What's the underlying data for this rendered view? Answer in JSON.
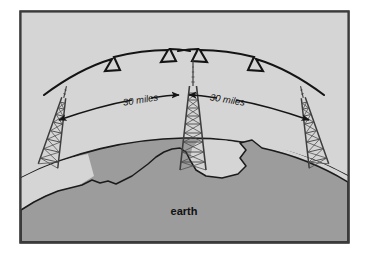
{
  "figure": {
    "kind": "diagram",
    "title_visible": false,
    "frame": {
      "border_color": "#3a3a3a",
      "sky_color": "#d4d4d4",
      "earth_color": "#9a9a9a",
      "line_color": "#1a1a1a",
      "x": 20,
      "y": 11,
      "width": 329,
      "height": 232
    },
    "labels": {
      "earth": "earth",
      "distance_left": "30 miles",
      "distance_right": "30 miles"
    },
    "towers": [
      {
        "name": "left-tower",
        "x": 48,
        "base_y": 166,
        "top_y": 84,
        "tilt_deg": 13,
        "half_width": 11
      },
      {
        "name": "center-tower",
        "x": 193,
        "base_y": 170,
        "top_y": 72,
        "tilt_deg": 0,
        "half_width": 13
      },
      {
        "name": "right-tower",
        "x": 319,
        "base_y": 166,
        "top_y": 84,
        "tilt_deg": -13,
        "half_width": 11
      }
    ],
    "radio_waves": [
      {
        "name": "wave-left",
        "from": "left-tower",
        "to": "center-tower",
        "zigzags": 2
      },
      {
        "name": "wave-right",
        "from": "center-tower",
        "to": "right-tower",
        "zigzags": 2
      }
    ],
    "distance_arrows": [
      {
        "name": "arrow-left",
        "label": "30 miles",
        "double_headed": true
      },
      {
        "name": "arrow-right",
        "label": "30 miles",
        "double_headed": true
      }
    ]
  }
}
